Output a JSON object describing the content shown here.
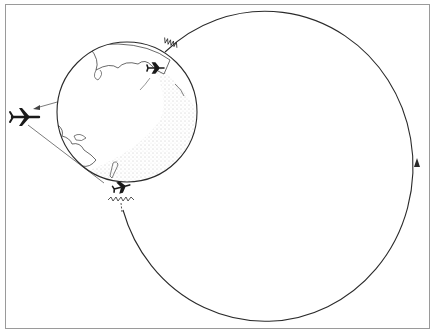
{
  "diagram": {
    "elements": {
      "globe": "earth-globe",
      "orbit_path": "signal-loop",
      "orbit_direction": "counter-clockwise",
      "aircraft": [
        "distant-aircraft",
        "aircraft-upper-on-globe",
        "aircraft-lower-on-globe"
      ],
      "signal_emitters": [
        "signal-upper",
        "signal-lower"
      ],
      "sight_lines": [
        "sight-line-upper",
        "sight-line-lower"
      ]
    },
    "colors": {
      "stroke": "#2a2a2a",
      "frame": "#9a9a9a",
      "stipple": "#8a8a8a",
      "background": "#ffffff"
    }
  }
}
